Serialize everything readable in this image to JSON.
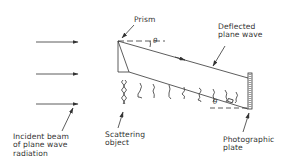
{
  "diagram": {
    "labels": {
      "prism": "Prism",
      "deflected_wave": "Deflected\nplane wave",
      "incident_beam": "Incident beam\nof plane wave\nradiation",
      "scattering_object": "Scattering\nobject",
      "photographic_plate": "Photographic\nplate",
      "theta_top": "θ",
      "theta_bottom": "θ"
    },
    "colors": {
      "line": "#333333",
      "background": "#ffffff"
    },
    "incident_arrows": 3
  }
}
